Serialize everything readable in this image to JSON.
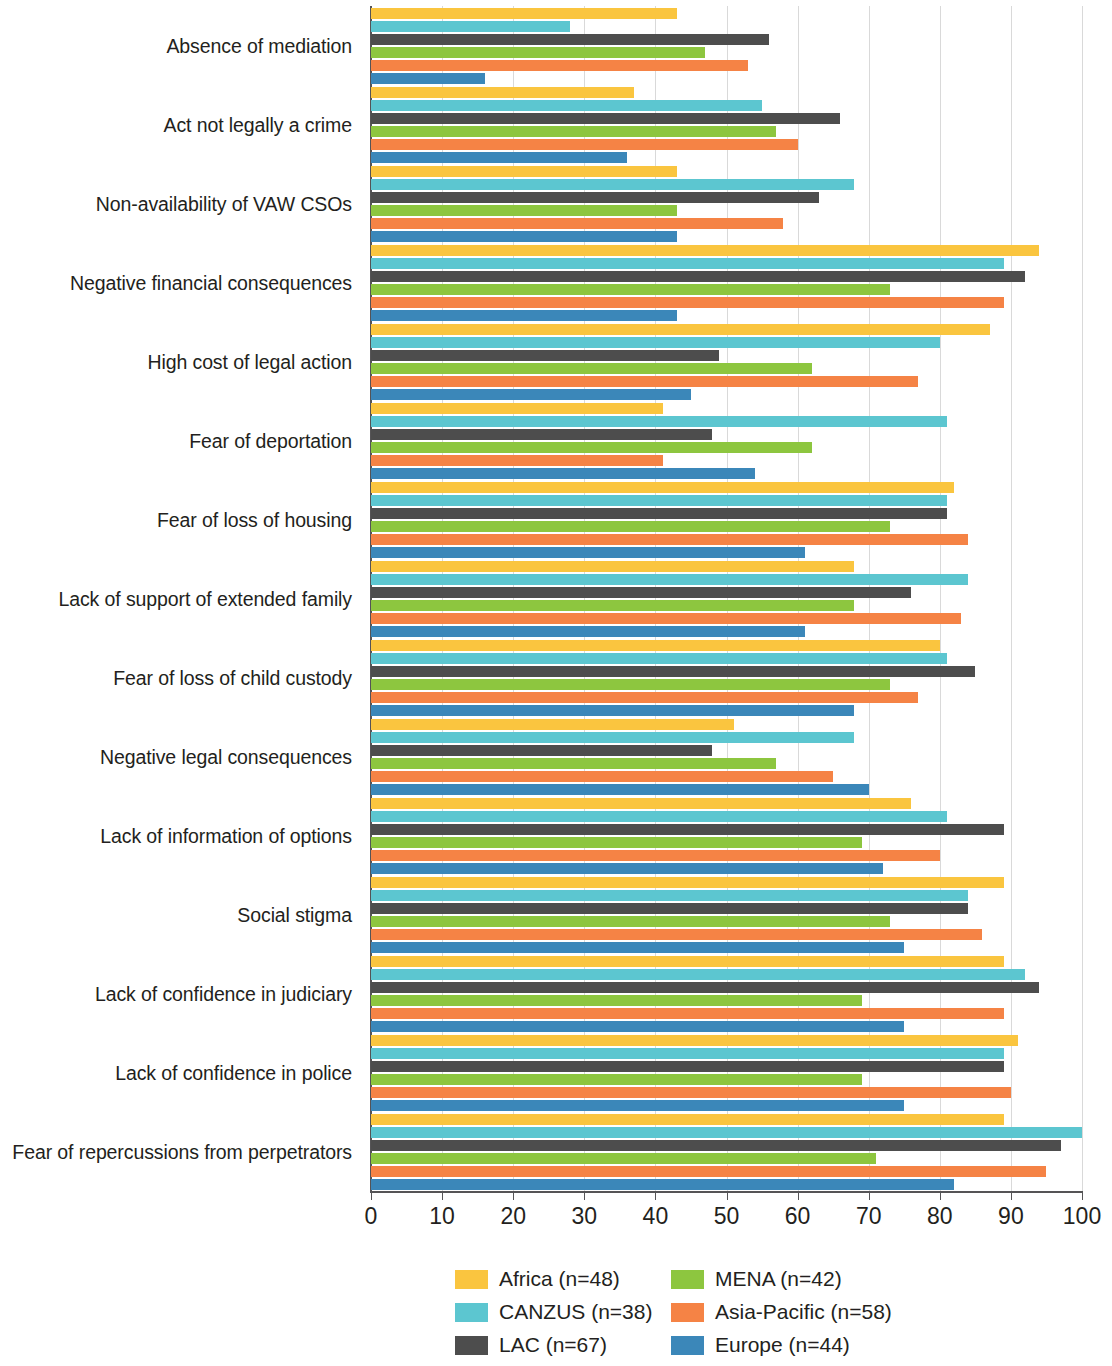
{
  "chart_data": {
    "type": "bar",
    "orientation": "horizontal",
    "title": "",
    "subtitle": "",
    "xlabel": "",
    "ylabel": "",
    "xlim": [
      0,
      100
    ],
    "xticks": [
      0,
      10,
      20,
      30,
      40,
      50,
      60,
      70,
      80,
      90,
      100
    ],
    "xticklabels": [
      "0",
      "10",
      "20",
      "30",
      "40",
      "50",
      "60",
      "70",
      "80",
      "90",
      "100"
    ],
    "grid": "vertical",
    "legend_position": "bottom",
    "categories": [
      "Absence of mediation",
      "Act not legally a crime",
      "Non-availability of VAW CSOs",
      "Negative financial consequences",
      "High cost of legal action",
      "Fear of deportation",
      "Fear of loss of housing",
      "Lack of support of extended family",
      "Fear of loss of child custody",
      "Negative legal consequences",
      "Lack of information of options",
      "Social stigma",
      "Lack of confidence in judiciary",
      "Lack of confidence in police",
      "Fear of repercussions from perpetrators"
    ],
    "series": [
      {
        "name": "Africa (n=48)",
        "label": "Africa (n=48)",
        "color": "#fac53f",
        "values": [
          43,
          37,
          43,
          94,
          87,
          41,
          82,
          68,
          80,
          51,
          76,
          89,
          89,
          91,
          89
        ]
      },
      {
        "name": "CANZUS (n=38)",
        "label": "CANZUS (n=38)",
        "color": "#5cc6d0",
        "values": [
          28,
          55,
          68,
          89,
          80,
          81,
          81,
          84,
          81,
          68,
          81,
          84,
          92,
          89,
          100
        ]
      },
      {
        "name": "LAC (n=67)",
        "label": "LAC (n=67)",
        "color": "#4d4d4d",
        "values": [
          56,
          66,
          63,
          92,
          49,
          48,
          81,
          76,
          85,
          48,
          89,
          84,
          94,
          89,
          97
        ]
      },
      {
        "name": "MENA (n=42)",
        "label": "MENA (n=42)",
        "color": "#8dc63f",
        "values": [
          47,
          57,
          43,
          73,
          62,
          62,
          73,
          68,
          73,
          57,
          69,
          73,
          69,
          69,
          71
        ]
      },
      {
        "name": "Asia-Pacific (n=58)",
        "label": "Asia-Pacific (n=58)",
        "color": "#f58345",
        "values": [
          53,
          60,
          58,
          89,
          77,
          41,
          84,
          83,
          77,
          65,
          80,
          86,
          89,
          90,
          95
        ]
      },
      {
        "name": "Europe (n=44)",
        "label": "Europe (n=44)",
        "color": "#3b87b9",
        "values": [
          16,
          36,
          43,
          43,
          45,
          54,
          61,
          61,
          68,
          70,
          72,
          75,
          75,
          75,
          82
        ]
      }
    ]
  },
  "legend": {
    "columns": [
      {
        "items": [
          0,
          1,
          2
        ]
      },
      {
        "items": [
          3,
          4,
          5
        ]
      }
    ]
  }
}
